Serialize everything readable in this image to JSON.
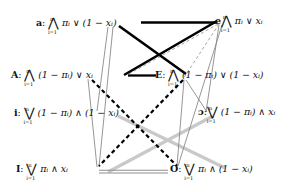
{
  "diagram": {
    "type": "logical-square-of-opposition-graph",
    "title": "",
    "background_color": "#ffffff",
    "nodes": [
      {
        "id": "a",
        "tag": "a",
        "separator": ":",
        "quantifier": "AND",
        "quantifier_glyph": "⋀",
        "index_lower": "i=1",
        "index_upper": "n",
        "body": "πᵢ ∨ (1 − xᵢ)",
        "full_text": "a: ⋀ᵢ₌₁ⁿ πᵢ ∨ (1 − xᵢ)",
        "position": "top-left"
      },
      {
        "id": "e",
        "tag": "e",
        "separator": ":",
        "quantifier": "AND",
        "quantifier_glyph": "⋀",
        "index_lower": "i=1",
        "index_upper": "n",
        "body": "πᵢ ∨ xᵢ",
        "full_text": "e: ⋀ᵢ₌₁ⁿ πᵢ ∨ xᵢ",
        "position": "top-right"
      },
      {
        "id": "A",
        "tag": "A",
        "separator": ":",
        "quantifier": "AND",
        "quantifier_glyph": "⋀",
        "index_lower": "i=1",
        "index_upper": "n",
        "body": "(1 − πᵢ) ∨ xᵢ",
        "full_text": "A: ⋀ᵢ₌₁ⁿ (1 − πᵢ) ∨ xᵢ",
        "position": "upper-middle-left"
      },
      {
        "id": "E",
        "tag": "E",
        "separator": ":",
        "quantifier": "AND",
        "quantifier_glyph": "⋀",
        "index_lower": "i=1",
        "index_upper": "n",
        "body": "(1 − πᵢ) ∨ (1 − xᵢ)",
        "full_text": "E: ⋀ᵢ₌₁ⁿ (1 − πᵢ) ∨ (1 − xᵢ)",
        "position": "upper-middle-right"
      },
      {
        "id": "i",
        "tag": "i",
        "separator": ":",
        "quantifier": "OR",
        "quantifier_glyph": "⋁",
        "index_lower": "i=1",
        "index_upper": "n",
        "body": "(1 − πᵢ) ∧ (1 − xᵢ)",
        "full_text": "i: ⋁ᵢ₌₁ⁿ (1 − πᵢ) ∧ (1 − xᵢ)",
        "position": "lower-middle-left"
      },
      {
        "id": "o",
        "tag": "ɔ",
        "separator": ":",
        "quantifier": "OR",
        "quantifier_glyph": "⋁",
        "index_lower": "i=1",
        "index_upper": "n",
        "body": "(1 − πᵢ) ∧ xᵢ",
        "full_text": "ɔ: ⋁ᵢ₌₁ⁿ (1 − πᵢ) ∧ xᵢ",
        "position": "lower-middle-right"
      },
      {
        "id": "I",
        "tag": "I",
        "separator": ":",
        "quantifier": "OR",
        "quantifier_glyph": "⋁",
        "index_lower": "i=1",
        "index_upper": "n",
        "body": "πᵢ ∧ xᵢ",
        "full_text": "I: ⋁ᵢ₌₁ⁿ πᵢ ∧ xᵢ",
        "position": "bottom-left"
      },
      {
        "id": "O",
        "tag": "O",
        "separator": ":",
        "quantifier": "OR",
        "quantifier_glyph": "⋁",
        "index_lower": "i=1",
        "index_upper": "n",
        "body": "πᵢ ∧ (1 − xᵢ)",
        "full_text": "O: ⋁ᵢ₌₁ⁿ πᵢ ∧ (1 − xᵢ)",
        "position": "bottom-right"
      }
    ],
    "edge_styles": {
      "thick_black_solid": {
        "color": "#000000",
        "width": 2.6,
        "dash": "none"
      },
      "thick_black_dashed": {
        "color": "#000000",
        "width": 2.4,
        "dash": "4,3"
      },
      "thin_gray_solid": {
        "color": "#8a8a8a",
        "width": 0.9,
        "dash": "none"
      },
      "thin_gray_dashed": {
        "color": "#9a9a9a",
        "width": 0.9,
        "dash": "3,2.5"
      },
      "thick_light_gray": {
        "color": "#c9c9c9",
        "width": 3.0,
        "dash": "none"
      },
      "double_gray": {
        "color": "#9b9b9b",
        "width": 2.4,
        "dash": "none"
      }
    },
    "edges": [
      {
        "from": "a",
        "to": "e",
        "style": "thick_black_solid"
      },
      {
        "from": "a",
        "to": "E",
        "style": "thick_black_solid"
      },
      {
        "from": "A",
        "to": "e",
        "style": "thick_black_solid"
      },
      {
        "from": "A",
        "to": "E",
        "style": "thick_black_solid"
      },
      {
        "from": "A",
        "to": "O",
        "style": "thick_black_dashed"
      },
      {
        "from": "E",
        "to": "I",
        "style": "thick_black_dashed"
      },
      {
        "from": "A",
        "to": "e",
        "style": "thin_gray_dashed"
      },
      {
        "from": "E",
        "to": "e",
        "style": "thin_gray_dashed"
      },
      {
        "from": "i",
        "to": "O",
        "style": "thick_light_gray"
      },
      {
        "from": "o",
        "to": "I",
        "style": "thick_light_gray"
      },
      {
        "from": "I",
        "to": "O",
        "style": "double_gray"
      },
      {
        "from": "a",
        "to": "I",
        "style": "thin_gray_solid"
      },
      {
        "from": "a",
        "to": "i",
        "style": "thin_gray_solid"
      },
      {
        "from": "A",
        "to": "I",
        "style": "thin_gray_solid"
      },
      {
        "from": "e",
        "to": "o",
        "style": "thin_gray_solid"
      },
      {
        "from": "e",
        "to": "O",
        "style": "thin_gray_solid"
      },
      {
        "from": "E",
        "to": "o",
        "style": "thin_gray_solid"
      },
      {
        "from": "E",
        "to": "O",
        "style": "thin_gray_solid"
      }
    ]
  }
}
